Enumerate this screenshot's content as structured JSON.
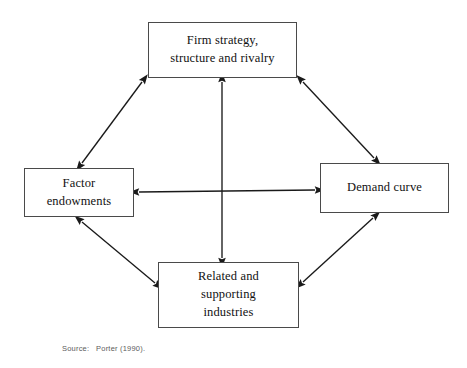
{
  "figure": {
    "type": "diagram",
    "subtype": "porter-diamond-model",
    "source_caption": "Source:   Porter (1990).",
    "stroke_color": "#4a4a4a",
    "arrow_color": "#1a1a1a",
    "background_color": "#ffffff"
  },
  "nodes": [
    {
      "id": "firm-strategy",
      "label": "Firm strategy,\nstructure and rivalry",
      "position": "top"
    },
    {
      "id": "factor-endowments",
      "label": "Factor\nendowments",
      "position": "left"
    },
    {
      "id": "demand-curve",
      "label": "Demand curve",
      "position": "right"
    },
    {
      "id": "related-supporting",
      "label": "Related and\nsupporting\nindustries",
      "position": "bottom"
    }
  ],
  "connections": [
    {
      "id": "firm-to-factor",
      "from": "firm-strategy",
      "to": "factor-endowments",
      "style": "double-headed-arrow",
      "orientation": "diagonal"
    },
    {
      "id": "firm-to-demand",
      "from": "firm-strategy",
      "to": "demand-curve",
      "style": "double-headed-arrow",
      "orientation": "diagonal"
    },
    {
      "id": "factor-to-related",
      "from": "factor-endowments",
      "to": "related-supporting",
      "style": "double-headed-arrow",
      "orientation": "diagonal"
    },
    {
      "id": "demand-to-related",
      "from": "demand-curve",
      "to": "related-supporting",
      "style": "double-headed-arrow",
      "orientation": "diagonal"
    },
    {
      "id": "factor-to-demand",
      "from": "factor-endowments",
      "to": "demand-curve",
      "style": "double-headed-arrow",
      "orientation": "horizontal"
    },
    {
      "id": "firm-to-related",
      "from": "firm-strategy",
      "to": "related-supporting",
      "style": "double-headed-arrow",
      "orientation": "vertical"
    }
  ]
}
